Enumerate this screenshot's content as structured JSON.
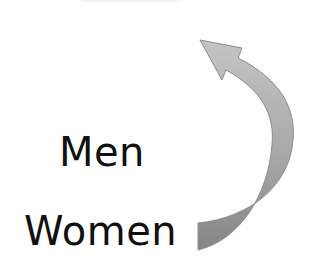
{
  "diagram": {
    "labels": {
      "men": "Men",
      "women": "Women"
    },
    "arrow": {
      "direction": "curved-upward-counterclockwise",
      "from": "Women",
      "fill_light": "#bdbdbd",
      "fill_dark": "#8a8a8a",
      "stroke": "#9a9a9a"
    }
  }
}
